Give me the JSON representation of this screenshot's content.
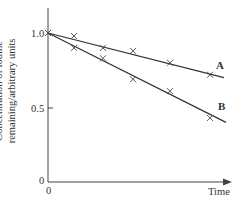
{
  "chart_data": {
    "type": "line",
    "title": "",
    "xlabel": "Time",
    "ylabel": [
      "Concentration of iodine",
      "remaining/arbitrary units"
    ],
    "x_ticks": [
      "0"
    ],
    "y_ticks": [
      "0",
      "0.5",
      "1.0"
    ],
    "ylim": [
      0,
      1.2
    ],
    "grid": false,
    "x": [
      0,
      1,
      2,
      3,
      4,
      5
    ],
    "series": [
      {
        "name": "A",
        "values": [
          1.0,
          0.98,
          0.9,
          0.88,
          0.8,
          0.72
        ],
        "line_end": 0.7
      },
      {
        "name": "B",
        "values": [
          1.0,
          0.9,
          0.83,
          0.69,
          0.61,
          0.43
        ],
        "line_end": 0.4
      }
    ]
  },
  "labels": {
    "series_a": "A",
    "series_b": "B",
    "y_tick_1": "1.0",
    "y_tick_05": "0.5",
    "y_tick_0": "0",
    "x_tick_0": "0",
    "x_axis": "Time",
    "y_axis_line1": "Concentration of iodine",
    "y_axis_line2": "remaining/arbitrary units"
  }
}
